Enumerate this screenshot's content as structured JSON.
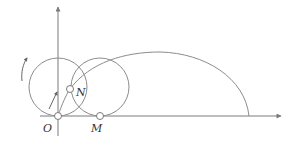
{
  "diagram": {
    "colors": {
      "stroke": "#8c8c8c",
      "axis": "#7a7a7a",
      "point_fill": "#ffffff",
      "label": "#333333"
    },
    "axes": {
      "origin": {
        "x": 58,
        "y": 116
      },
      "x_axis": {
        "x1": 40,
        "x2": 281,
        "y": 116
      },
      "y_axis": {
        "x": 58,
        "y1": 136,
        "y2": 7
      }
    },
    "circles": [
      {
        "name": "left-circle",
        "cx": 58,
        "cy": 87,
        "r": 29
      },
      {
        "name": "right-circle",
        "cx": 100,
        "cy": 87,
        "r": 29
      }
    ],
    "points": [
      {
        "name": "O",
        "label": "O",
        "x": 58,
        "y": 116,
        "label_x": 43,
        "label_y": 132
      },
      {
        "name": "M",
        "label": "M",
        "x": 100,
        "y": 116,
        "label_x": 91,
        "label_y": 132
      },
      {
        "name": "N",
        "label": "N",
        "x": 70,
        "y": 89,
        "label_x": 76,
        "label_y": 96
      }
    ],
    "trajectory_path": "M58,116 C62,104 66,95 70,89 C90,62 125,52 160,52 C205,53 245,78 249,116",
    "rotation_arrow_path": "M22,81 C21,72 23,64 27,58",
    "radius_arrow": {
      "x1": 49,
      "y1": 109,
      "x2": 57,
      "y2": 92
    }
  }
}
